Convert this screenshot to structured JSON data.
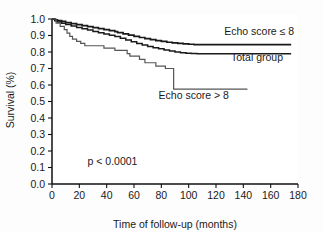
{
  "figure": {
    "background_color": "#fdfdfd",
    "axis_color": "#111111",
    "text_color": "#1a1a1a"
  },
  "chart_data": {
    "type": "line",
    "subtype": "kaplan-meier-step",
    "title": "",
    "xlabel": "Time of follow-up (months)",
    "ylabel": "Survival (%)",
    "xlim": [
      0,
      180
    ],
    "ylim": [
      0.0,
      1.0
    ],
    "xticks": [
      0,
      20,
      40,
      60,
      80,
      100,
      120,
      140,
      160,
      180
    ],
    "xtick_labels": [
      "0",
      "20",
      "40",
      "60",
      "80",
      "100",
      "120",
      "140",
      "160",
      "180"
    ],
    "yticks": [
      0.0,
      0.1,
      0.2,
      0.3,
      0.4,
      0.5,
      0.6,
      0.7,
      0.8,
      0.9,
      1.0
    ],
    "ytick_labels": [
      "0.0",
      "0.1",
      "0.2",
      "0.3",
      "0.4",
      "0.5",
      "0.6",
      "0.7",
      "0.8",
      "0.9",
      "1.0"
    ],
    "grid": false,
    "legend_position": "inline-annotations",
    "annotations": [
      {
        "name": "p-value",
        "text": "p < 0.0001",
        "x": 26,
        "y": 0.115
      }
    ],
    "series": [
      {
        "name": "Echo score ≤ 8",
        "label": "Echo score ≤ 8",
        "color": "#1a1a1a",
        "line_width": 1.7,
        "label_position": {
          "x": 126,
          "y": 0.905
        },
        "points": [
          [
            0,
            1.0
          ],
          [
            2,
            0.995
          ],
          [
            4,
            0.99
          ],
          [
            7,
            0.985
          ],
          [
            10,
            0.978
          ],
          [
            14,
            0.972
          ],
          [
            18,
            0.966
          ],
          [
            22,
            0.96
          ],
          [
            26,
            0.954
          ],
          [
            30,
            0.948
          ],
          [
            34,
            0.942
          ],
          [
            38,
            0.936
          ],
          [
            42,
            0.93
          ],
          [
            46,
            0.924
          ],
          [
            48,
            0.918
          ],
          [
            52,
            0.91
          ],
          [
            56,
            0.902
          ],
          [
            60,
            0.895
          ],
          [
            64,
            0.888
          ],
          [
            68,
            0.881
          ],
          [
            72,
            0.875
          ],
          [
            76,
            0.869
          ],
          [
            80,
            0.864
          ],
          [
            84,
            0.859
          ],
          [
            88,
            0.855
          ],
          [
            92,
            0.852
          ],
          [
            96,
            0.849
          ],
          [
            100,
            0.847
          ],
          [
            104,
            0.845
          ],
          [
            120,
            0.845
          ],
          [
            140,
            0.845
          ],
          [
            160,
            0.845
          ],
          [
            175,
            0.845
          ]
        ]
      },
      {
        "name": "Total group",
        "label": "Total group",
        "color": "#1a1a1a",
        "line_width": 1.5,
        "label_position": {
          "x": 131,
          "y": 0.745
        },
        "points": [
          [
            0,
            1.0
          ],
          [
            2,
            0.99
          ],
          [
            4,
            0.982
          ],
          [
            7,
            0.974
          ],
          [
            10,
            0.966
          ],
          [
            14,
            0.957
          ],
          [
            18,
            0.949
          ],
          [
            22,
            0.941
          ],
          [
            26,
            0.933
          ],
          [
            30,
            0.925
          ],
          [
            34,
            0.917
          ],
          [
            38,
            0.909
          ],
          [
            42,
            0.901
          ],
          [
            46,
            0.894
          ],
          [
            50,
            0.884
          ],
          [
            54,
            0.873
          ],
          [
            58,
            0.862
          ],
          [
            62,
            0.852
          ],
          [
            66,
            0.843
          ],
          [
            70,
            0.834
          ],
          [
            74,
            0.826
          ],
          [
            78,
            0.819
          ],
          [
            82,
            0.812
          ],
          [
            86,
            0.806
          ],
          [
            90,
            0.8
          ],
          [
            94,
            0.796
          ],
          [
            98,
            0.793
          ],
          [
            102,
            0.791
          ],
          [
            106,
            0.79
          ],
          [
            120,
            0.79
          ],
          [
            140,
            0.79
          ],
          [
            160,
            0.79
          ],
          [
            175,
            0.79
          ]
        ]
      },
      {
        "name": "Echo score > 8",
        "label": "Echo score > 8",
        "color": "#555555",
        "line_width": 1.2,
        "label_position": {
          "x": 78,
          "y": 0.515
        },
        "points": [
          [
            0,
            1.0
          ],
          [
            3,
            0.975
          ],
          [
            6,
            0.955
          ],
          [
            9,
            0.935
          ],
          [
            11,
            0.915
          ],
          [
            13,
            0.895
          ],
          [
            15,
            0.878
          ],
          [
            18,
            0.865
          ],
          [
            21,
            0.852
          ],
          [
            24,
            0.838
          ],
          [
            36,
            0.838
          ],
          [
            38,
            0.823
          ],
          [
            43,
            0.823
          ],
          [
            46,
            0.81
          ],
          [
            52,
            0.81
          ],
          [
            55,
            0.79
          ],
          [
            57,
            0.775
          ],
          [
            62,
            0.775
          ],
          [
            64,
            0.755
          ],
          [
            68,
            0.735
          ],
          [
            74,
            0.735
          ],
          [
            76,
            0.715
          ],
          [
            81,
            0.715
          ],
          [
            83,
            0.7
          ],
          [
            88,
            0.7
          ],
          [
            89,
            0.575
          ],
          [
            100,
            0.575
          ],
          [
            120,
            0.575
          ],
          [
            143,
            0.575
          ]
        ]
      }
    ]
  }
}
